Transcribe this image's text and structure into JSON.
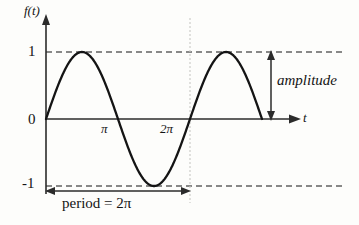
{
  "chart_data": {
    "type": "line",
    "title": "",
    "subtitle": "",
    "function": "f(t) = sin(t)",
    "xlabel": "t",
    "ylabel": "f(t)",
    "xlim": [
      0,
      10.6
    ],
    "ylim": [
      -1.45,
      1.55
    ],
    "grid": false,
    "legend_position": "none",
    "x_tick_labels": [
      "π",
      "2π"
    ],
    "x_tick_values": [
      3.14159,
      6.28319
    ],
    "y_tick_labels": [
      "1",
      "0",
      "-1"
    ],
    "y_tick_values": [
      1,
      0,
      -1
    ],
    "series": [
      {
        "name": "sin(t)",
        "color": "#141414",
        "x": [
          0.0,
          0.3927,
          0.7854,
          1.1781,
          1.5708,
          1.9635,
          2.3562,
          2.7489,
          3.1416,
          3.5343,
          3.927,
          4.3197,
          4.7124,
          5.1051,
          5.4978,
          5.8905,
          6.2832,
          6.6759,
          7.0686,
          7.4613,
          7.854,
          8.2467,
          8.6394,
          9.0321,
          9.4248
        ],
        "values": [
          0.0,
          0.3827,
          0.7071,
          0.9239,
          1.0,
          0.9239,
          0.7071,
          0.3827,
          0.0,
          -0.3827,
          -0.7071,
          -0.9239,
          -1.0,
          -0.9239,
          -0.7071,
          -0.3827,
          0.0,
          0.3827,
          0.7071,
          0.9239,
          1.0,
          0.9239,
          0.7071,
          0.3827,
          0.0
        ]
      }
    ],
    "reference_lines": [
      {
        "name": "upper-amplitude-line",
        "axis": "y",
        "value": 1,
        "style": "dashed",
        "color": "#141414"
      },
      {
        "name": "lower-amplitude-line",
        "axis": "y",
        "value": -1,
        "style": "dashed",
        "color": "#141414"
      },
      {
        "name": "period-end-line",
        "axis": "x",
        "value": 6.28319,
        "style": "dotted",
        "color": "#c9c9c5"
      }
    ],
    "annotations": [
      {
        "name": "amplitude",
        "label": "amplitude",
        "arrow": "double-vertical",
        "from": 0,
        "to": 1
      },
      {
        "name": "period",
        "label": "period = 2π",
        "arrow": "double-horizontal",
        "from": 0,
        "to": 6.28319
      }
    ]
  },
  "labels": {
    "y_axis_name": "f(t)",
    "x_axis_name": "t",
    "tick_one": "1",
    "tick_zero": "0",
    "tick_neg_one": "-1",
    "tick_pi": "π",
    "tick_two_pi": "2π",
    "amplitude": "amplitude",
    "period": "period = 2π"
  },
  "colors": {
    "curve": "#141414",
    "axis": "#2b2b2b",
    "dashed": "#141414",
    "dotted_guide": "#c9c9c5",
    "background": "#fdfdfb"
  }
}
